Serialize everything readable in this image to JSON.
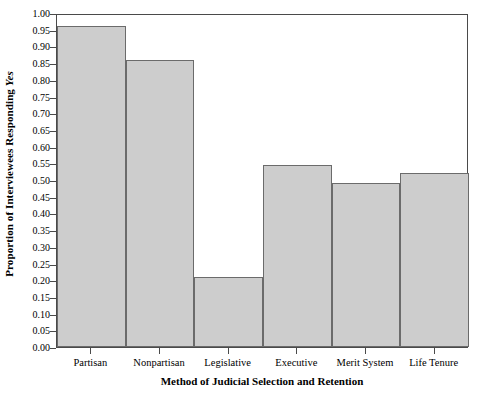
{
  "chart_data": {
    "type": "bar",
    "title": "",
    "subtitle": "",
    "xlabel": "Method of Judicial Selection and Retention",
    "ylabel": "Proportion of Interviewees Responding Yes",
    "ylabel_parts": {
      "plain": "Proportion of Interviewees Responding ",
      "italic": "Yes"
    },
    "categories": [
      "Partisan",
      "Nonpartisan",
      "Legislative",
      "Executive",
      "Merit System",
      "Life Tenure"
    ],
    "values": [
      0.96,
      0.86,
      0.21,
      0.545,
      0.49,
      0.52
    ],
    "ylim": [
      0.0,
      1.0
    ],
    "ytick_labels": [
      "0.00",
      "0.05",
      "0.10",
      "0.15",
      "0.20",
      "0.25",
      "0.30",
      "0.35",
      "0.40",
      "0.45",
      "0.50",
      "0.55",
      "0.60",
      "0.65",
      "0.70",
      "0.75",
      "0.80",
      "0.85",
      "0.90",
      "0.95",
      "1.00"
    ],
    "ytick_values": [
      0.0,
      0.05,
      0.1,
      0.15,
      0.2,
      0.25,
      0.3,
      0.35,
      0.4,
      0.45,
      0.5,
      0.55,
      0.6,
      0.65,
      0.7,
      0.75,
      0.8,
      0.85,
      0.9,
      0.95,
      1.0
    ],
    "grid": false,
    "legend": null,
    "bar_fill_color": "#cdcdcd",
    "bar_edge_color": "#6b6b6b",
    "axis_color": "#4a4a4a",
    "background_color": "#ffffff",
    "bar_gap": 0
  }
}
